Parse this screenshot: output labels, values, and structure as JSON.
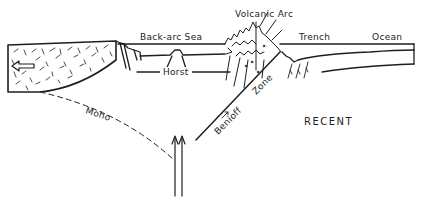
{
  "figure": {
    "title": "RECENT",
    "type": "tectonic cross-section"
  },
  "labels": {
    "back_arc_sea": "Back-arc Sea",
    "volcanic_arc": "Volcanic Arc",
    "trench": "Trench",
    "ocean": "Ocean",
    "horst": "Horst",
    "moho": "Moho",
    "benioff_zone_1": "Benioff",
    "benioff_zone_2": "Zone",
    "period": "RECENT"
  },
  "colors": {
    "ink": "#1e1e1e",
    "background": "#ffffff"
  }
}
